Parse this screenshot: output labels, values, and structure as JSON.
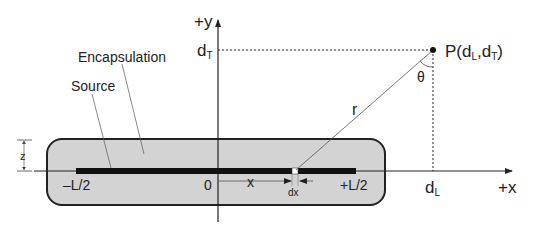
{
  "diagram": {
    "axes": {
      "y_label": "+y",
      "x_label": "+x",
      "origin_label": "0"
    },
    "labels": {
      "encapsulation": "Encapsulation",
      "source": "Source",
      "z": "z",
      "minus_half_length": "–L/2",
      "plus_half_length": "+L/2",
      "x": "x",
      "dx": "dx",
      "r": "r",
      "theta": "θ",
      "dT_main": "d",
      "dT_sub": "T",
      "dL_main": "d",
      "dL_sub": "L",
      "point_prefix": "P(d",
      "point_sub1": "L",
      "point_mid": ",d",
      "point_sub2": "T",
      "point_suffix": ")"
    },
    "colors": {
      "encapsulation_fill": "#d3d3d3",
      "source_fill": "#111111",
      "line": "#222222"
    }
  }
}
